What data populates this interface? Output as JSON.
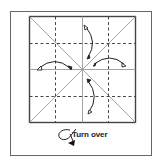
{
  "diagram": {
    "caption": "Turn over",
    "colors": {
      "frame": "#555555",
      "square": "#444444",
      "crease_solid": "#9a9a9a",
      "crease_dashed": "#333333",
      "arrow": "#222222",
      "background": "#ffffff"
    },
    "elements": {
      "outer_frame": "frame",
      "paper_square": "square",
      "diagonal_creases": 2,
      "center_creases": 2,
      "dashed_valley_folds": 4,
      "fold_unfold_arrows": 4,
      "turn_over_symbol": "loop-arrow"
    }
  }
}
